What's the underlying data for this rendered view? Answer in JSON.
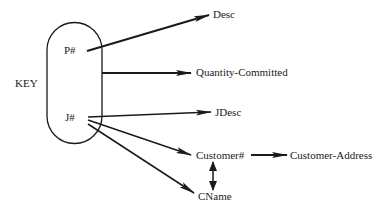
{
  "diagram": {
    "type": "functional-dependency",
    "key_label": "KEY",
    "key_attributes": [
      "P#",
      "J#"
    ],
    "nodes": {
      "p_num": "P#",
      "j_num": "J#",
      "desc": "Desc",
      "quantity_committed": "Quantity-Committed",
      "jdesc": "JDesc",
      "customer_num": "Customer#",
      "customer_address": "Customer-Address",
      "cname": "CName"
    },
    "edges": [
      {
        "from": "P#",
        "to": "Desc"
      },
      {
        "from": "KEY",
        "to": "Quantity-Committed"
      },
      {
        "from": "J#",
        "to": "JDesc"
      },
      {
        "from": "J#",
        "to": "Customer#"
      },
      {
        "from": "J#",
        "to": "CName"
      },
      {
        "from": "Customer#",
        "to": "Customer-Address"
      },
      {
        "from": "Customer#",
        "to": "CName",
        "bidirectional": true
      }
    ],
    "colors": {
      "line": "#1a1a1a",
      "background": "#ffffff"
    }
  }
}
